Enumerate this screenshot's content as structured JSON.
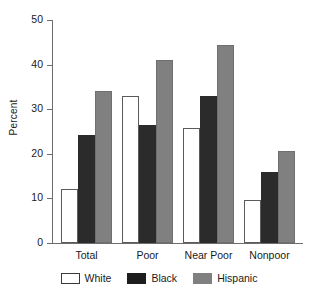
{
  "chart_data": {
    "type": "bar",
    "title": "",
    "xlabel": "",
    "ylabel": "Percent",
    "ylim": [
      0,
      50
    ],
    "yticks": [
      0,
      10,
      20,
      30,
      40,
      50
    ],
    "grid": false,
    "legend_position": "bottom-center",
    "categories": [
      "Total",
      "Poor",
      "Near Poor",
      "Nonpoor"
    ],
    "series": [
      {
        "name": "White",
        "color": "#ffffff",
        "values": [
          12.2,
          33.0,
          25.8,
          9.7
        ]
      },
      {
        "name": "Black",
        "color": "#2b2b2b",
        "values": [
          24.2,
          26.4,
          33.0,
          16.0
        ]
      },
      {
        "name": "Hispanic",
        "color": "#808080",
        "values": [
          34.0,
          41.0,
          44.3,
          20.6
        ]
      }
    ]
  },
  "axis": {
    "y_label": "Percent",
    "y_tick_labels": [
      "0",
      "10",
      "20",
      "30",
      "40",
      "50"
    ]
  },
  "legend": {
    "items": [
      {
        "label": "White"
      },
      {
        "label": "Black"
      },
      {
        "label": "Hispanic"
      }
    ]
  }
}
